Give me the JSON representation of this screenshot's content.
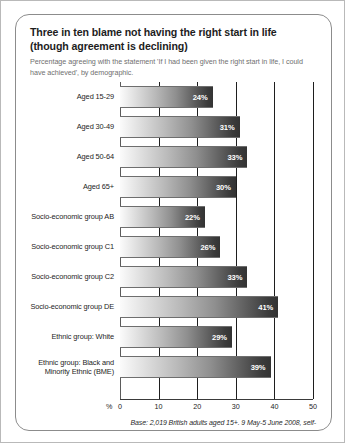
{
  "card": {
    "title": "Three in ten blame not having the right start in life (though agreement is declining)",
    "subtitle": "Percentage agreeing with the statement 'If I had been given the right start in life, I could have achieved', by demographic.",
    "footnote": "Base: 2,019 British adults aged 15+. 9 May-5 June 2008, self-completion and online. Source: Ipsos MORI."
  },
  "axis": {
    "percent_prefix": "%",
    "tick_labels": [
      "0",
      "10",
      "20",
      "30",
      "40",
      "50"
    ]
  },
  "chart_data": {
    "type": "bar",
    "orientation": "horizontal",
    "title": "Three in ten blame not having the right start in life (though agreement is declining)",
    "subtitle": "Percentage agreeing with the statement 'If I had been given the right start in life, I could have achieved', by demographic.",
    "xlabel": "%",
    "ylabel": "",
    "xlim": [
      0,
      50
    ],
    "xticks": [
      0,
      10,
      20,
      30,
      40,
      50
    ],
    "grid": true,
    "legend": null,
    "bar_color_start": "#fbfbfb",
    "bar_color_end": "#333333",
    "value_suffix": "%",
    "categories": [
      "Aged 15-29",
      "Aged 30-49",
      "Aged 50-64",
      "Aged 65+",
      "Socio-economic group AB",
      "Socio-economic group C1",
      "Socio-economic group C2",
      "Socio-economic group DE",
      "Ethnic group: White",
      "Ethnic group: Black and Minority Ethnic (BME)"
    ],
    "values": [
      24,
      31,
      33,
      30,
      22,
      26,
      33,
      41,
      29,
      39
    ],
    "value_labels": [
      "24%",
      "31%",
      "33%",
      "30%",
      "22%",
      "26%",
      "33%",
      "41%",
      "29%",
      "39%"
    ],
    "source": "Ipsos MORI",
    "base": "2,019 British adults aged 15+",
    "fieldwork": "9 May-5 June 2008, self-completion and online"
  }
}
